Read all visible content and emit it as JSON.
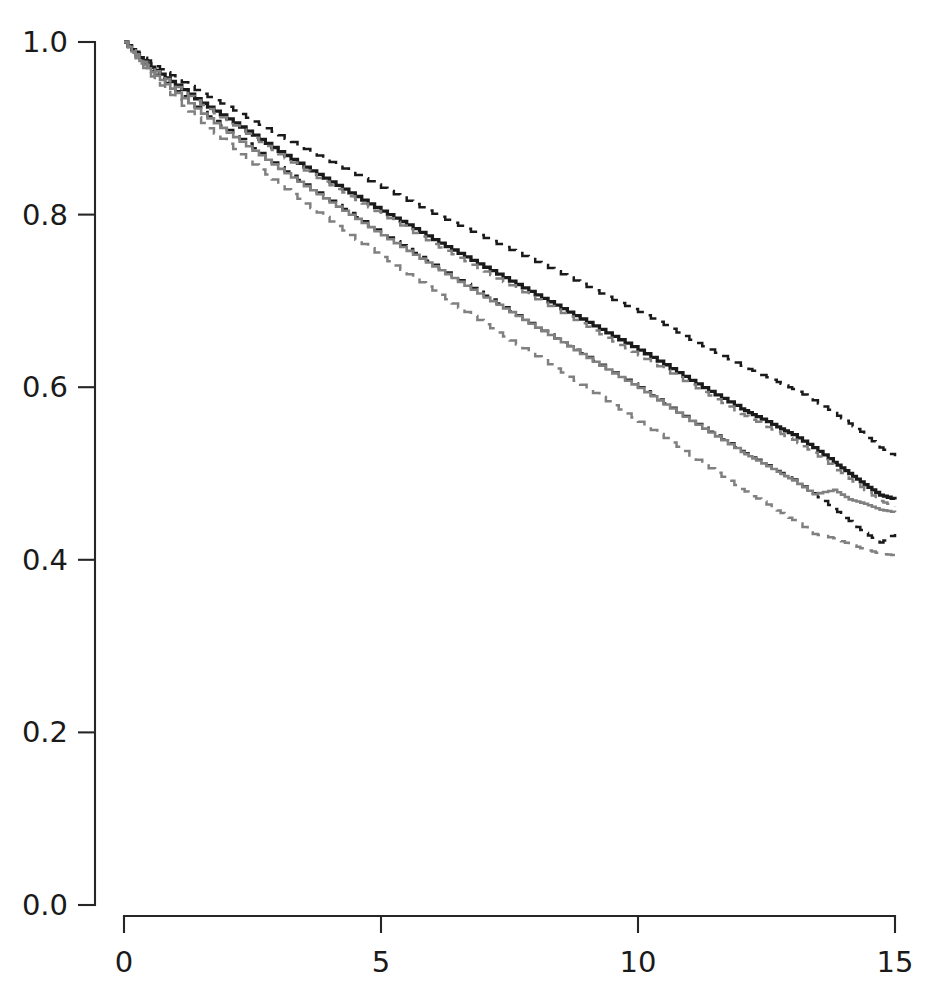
{
  "chart_data": {
    "type": "line",
    "title": "",
    "subtitle": "",
    "xlabel": "",
    "ylabel": "",
    "xlim": [
      0,
      15
    ],
    "ylim": [
      0,
      1
    ],
    "grid": false,
    "legend": null,
    "legend_position": "none",
    "x_ticks": [
      0,
      5,
      10,
      15
    ],
    "x_tick_labels": [
      "0",
      "5",
      "10",
      "15"
    ],
    "y_ticks": [
      0.0,
      0.2,
      0.4,
      0.6,
      0.8,
      1.0
    ],
    "y_tick_labels": [
      "0.0",
      "0.2",
      "0.4",
      "0.6",
      "0.8",
      "1.0"
    ],
    "step_type": "post",
    "colors": {
      "primary": "#1a1a1a",
      "secondary": "#808080",
      "background": "#ffffff",
      "axis": "#262626"
    },
    "series": [
      {
        "name": "group-1-upper-ci",
        "style": "dashed",
        "color": "#1a1a1a",
        "x": [
          0,
          0.3,
          0.6,
          1.0,
          1.5,
          2.0,
          2.5,
          3.0,
          3.5,
          4.0,
          4.5,
          5.0,
          5.5,
          6.0,
          6.5,
          7.0,
          7.5,
          8.0,
          8.5,
          9.0,
          9.5,
          10.0,
          10.5,
          11.0,
          11.5,
          12.0,
          12.3,
          12.7,
          13.0,
          13.4,
          13.8,
          14.1,
          14.4,
          14.7,
          15.0
        ],
        "y": [
          1.0,
          0.985,
          0.972,
          0.958,
          0.94,
          0.925,
          0.908,
          0.892,
          0.876,
          0.861,
          0.846,
          0.831,
          0.816,
          0.801,
          0.787,
          0.773,
          0.759,
          0.745,
          0.731,
          0.716,
          0.701,
          0.687,
          0.672,
          0.655,
          0.64,
          0.625,
          0.617,
          0.606,
          0.598,
          0.585,
          0.57,
          0.558,
          0.545,
          0.53,
          0.52
        ]
      },
      {
        "name": "group-1-estimate",
        "style": "solid",
        "color": "#1a1a1a",
        "x": [
          0,
          0.3,
          0.6,
          1.0,
          1.5,
          2.0,
          2.5,
          3.0,
          3.5,
          4.0,
          4.5,
          5.0,
          5.5,
          6.0,
          6.5,
          7.0,
          7.5,
          8.0,
          8.5,
          9.0,
          9.5,
          10.0,
          10.5,
          11.0,
          11.5,
          12.0,
          12.3,
          12.7,
          13.0,
          13.4,
          13.8,
          14.1,
          14.4,
          14.7,
          15.0
        ],
        "y": [
          1.0,
          0.982,
          0.967,
          0.95,
          0.929,
          0.911,
          0.892,
          0.873,
          0.855,
          0.838,
          0.821,
          0.804,
          0.788,
          0.771,
          0.755,
          0.739,
          0.723,
          0.707,
          0.691,
          0.675,
          0.659,
          0.643,
          0.626,
          0.608,
          0.591,
          0.575,
          0.566,
          0.554,
          0.545,
          0.53,
          0.513,
          0.5,
          0.487,
          0.475,
          0.47
        ]
      },
      {
        "name": "group-1-lower-ci",
        "style": "dashed",
        "color": "#1a1a1a",
        "x": [
          0,
          0.3,
          0.6,
          1.0,
          1.5,
          2.0,
          2.5,
          3.0,
          3.5,
          4.0,
          4.5,
          5.0,
          5.5,
          6.0,
          6.5,
          7.0,
          7.5,
          8.0,
          8.5,
          9.0,
          9.5,
          10.0,
          10.5,
          11.0,
          11.5,
          12.0,
          12.3,
          12.7,
          13.0,
          13.4,
          13.8,
          14.1,
          14.4,
          14.7,
          15.0
        ],
        "y": [
          1.0,
          0.979,
          0.962,
          0.943,
          0.919,
          0.898,
          0.877,
          0.855,
          0.835,
          0.816,
          0.797,
          0.778,
          0.76,
          0.742,
          0.724,
          0.706,
          0.688,
          0.67,
          0.652,
          0.635,
          0.617,
          0.6,
          0.581,
          0.562,
          0.544,
          0.526,
          0.516,
          0.503,
          0.493,
          0.477,
          0.459,
          0.445,
          0.431,
          0.42,
          0.43
        ]
      },
      {
        "name": "group-2-upper-ci",
        "style": "dashed",
        "color": "#808080",
        "x": [
          0,
          0.3,
          0.6,
          1.0,
          1.5,
          2.0,
          2.5,
          3.0,
          3.5,
          4.0,
          4.5,
          5.0,
          5.5,
          6.0,
          6.5,
          7.0,
          7.5,
          8.0,
          8.5,
          9.0,
          9.5,
          10.0,
          10.5,
          11.0,
          11.5,
          12.0,
          12.3,
          12.7,
          13.0,
          13.4,
          13.8,
          14.1,
          14.4,
          14.7,
          15.0
        ],
        "y": [
          1.0,
          0.981,
          0.966,
          0.948,
          0.927,
          0.908,
          0.889,
          0.87,
          0.851,
          0.834,
          0.817,
          0.8,
          0.783,
          0.766,
          0.75,
          0.734,
          0.718,
          0.702,
          0.686,
          0.67,
          0.653,
          0.637,
          0.62,
          0.603,
          0.586,
          0.569,
          0.56,
          0.548,
          0.539,
          0.524,
          0.507,
          0.494,
          0.481,
          0.468,
          0.462
        ]
      },
      {
        "name": "group-2-estimate",
        "style": "solid",
        "color": "#808080",
        "x": [
          0,
          0.3,
          0.6,
          1.0,
          1.5,
          2.0,
          2.5,
          3.0,
          3.5,
          4.0,
          4.5,
          5.0,
          5.5,
          6.0,
          6.5,
          7.0,
          7.5,
          8.0,
          8.5,
          9.0,
          9.5,
          10.0,
          10.5,
          11.0,
          11.5,
          12.0,
          12.3,
          12.7,
          13.0,
          13.4,
          13.8,
          14.1,
          14.4,
          14.7,
          15.0
        ],
        "y": [
          1.0,
          0.978,
          0.961,
          0.941,
          0.917,
          0.895,
          0.874,
          0.853,
          0.833,
          0.814,
          0.795,
          0.776,
          0.758,
          0.74,
          0.722,
          0.704,
          0.687,
          0.669,
          0.652,
          0.634,
          0.616,
          0.599,
          0.58,
          0.561,
          0.543,
          0.525,
          0.515,
          0.502,
          0.492,
          0.476,
          0.481,
          0.47,
          0.465,
          0.458,
          0.455
        ]
      },
      {
        "name": "group-2-lower-ci",
        "style": "dashed",
        "color": "#808080",
        "x": [
          0,
          0.3,
          0.6,
          1.0,
          1.5,
          2.0,
          2.5,
          3.0,
          3.5,
          4.0,
          4.5,
          5.0,
          5.5,
          6.0,
          6.5,
          7.0,
          7.5,
          8.0,
          8.5,
          9.0,
          9.5,
          10.0,
          10.5,
          11.0,
          11.5,
          12.0,
          12.3,
          12.7,
          13.0,
          13.4,
          13.8,
          14.1,
          14.4,
          14.7,
          15.0
        ],
        "y": [
          1.0,
          0.975,
          0.955,
          0.933,
          0.906,
          0.882,
          0.858,
          0.835,
          0.813,
          0.792,
          0.771,
          0.751,
          0.731,
          0.712,
          0.692,
          0.673,
          0.654,
          0.636,
          0.617,
          0.598,
          0.579,
          0.56,
          0.541,
          0.521,
          0.501,
          0.482,
          0.471,
          0.457,
          0.446,
          0.43,
          0.425,
          0.418,
          0.412,
          0.407,
          0.405
        ]
      }
    ]
  }
}
